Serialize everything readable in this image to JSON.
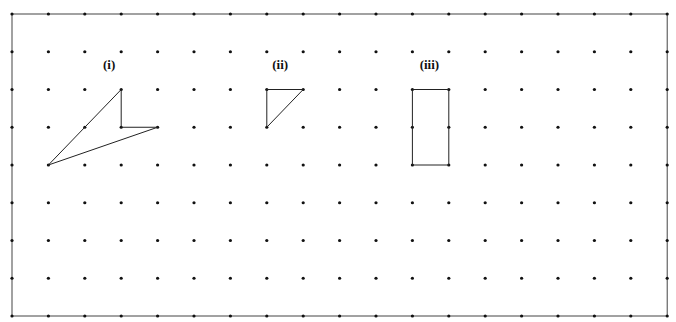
{
  "grid": {
    "cols": 19,
    "rows": 9,
    "x0": 12,
    "dx": 36.4,
    "y0": 14,
    "dy": 37.75,
    "dot_color": "#111111",
    "border_color": "#444444"
  },
  "figures": [
    {
      "label": "(i)",
      "label_pos": [
        2.5,
        1.45
      ],
      "points": [
        [
          1,
          4
        ],
        [
          3,
          2
        ],
        [
          3,
          3
        ],
        [
          4,
          3
        ]
      ]
    },
    {
      "label": "(ii)",
      "label_pos": [
        7.15,
        1.45
      ],
      "points": [
        [
          7,
          2
        ],
        [
          8,
          2
        ],
        [
          7,
          3
        ]
      ]
    },
    {
      "label": "(iii)",
      "label_pos": [
        11.2,
        1.45
      ],
      "points": [
        [
          11,
          2
        ],
        [
          12,
          2
        ],
        [
          12,
          4
        ],
        [
          11,
          4
        ]
      ]
    }
  ]
}
